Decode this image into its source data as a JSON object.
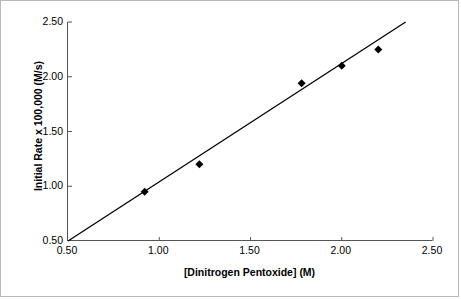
{
  "chart_data": {
    "type": "scatter",
    "title": "Initial Rate vs. Conc.",
    "xlabel": "[Dinitrogen Pentoxide] (M)",
    "ylabel": "Initial Rate x 100,000 (M/s)",
    "xlim": [
      0.5,
      2.5
    ],
    "ylim": [
      0.5,
      2.5
    ],
    "xticks": [
      "0.50",
      "1.00",
      "1.50",
      "2.00",
      "2.50"
    ],
    "yticks": [
      "0.50",
      "1.00",
      "1.50",
      "2.00",
      "2.50"
    ],
    "xtick_values": [
      0.5,
      1.0,
      1.5,
      2.0,
      2.5
    ],
    "ytick_values": [
      0.5,
      1.0,
      1.5,
      2.0,
      2.5
    ],
    "grid": false,
    "legend": "none",
    "marker": "diamond",
    "marker_color": "#000000",
    "line_color": "#000000",
    "points": [
      {
        "x": 0.92,
        "y": 0.95
      },
      {
        "x": 1.22,
        "y": 1.2
      },
      {
        "x": 1.78,
        "y": 1.94
      },
      {
        "x": 2.0,
        "y": 2.1
      },
      {
        "x": 2.2,
        "y": 2.25
      }
    ],
    "trendline": {
      "x1": 0.5,
      "y1": 0.5,
      "x2": 2.35,
      "y2": 2.5
    }
  },
  "colors": {
    "axis": "#555555",
    "frame": "#b9b9b9",
    "text": "#000000",
    "background": "#ffffff"
  }
}
